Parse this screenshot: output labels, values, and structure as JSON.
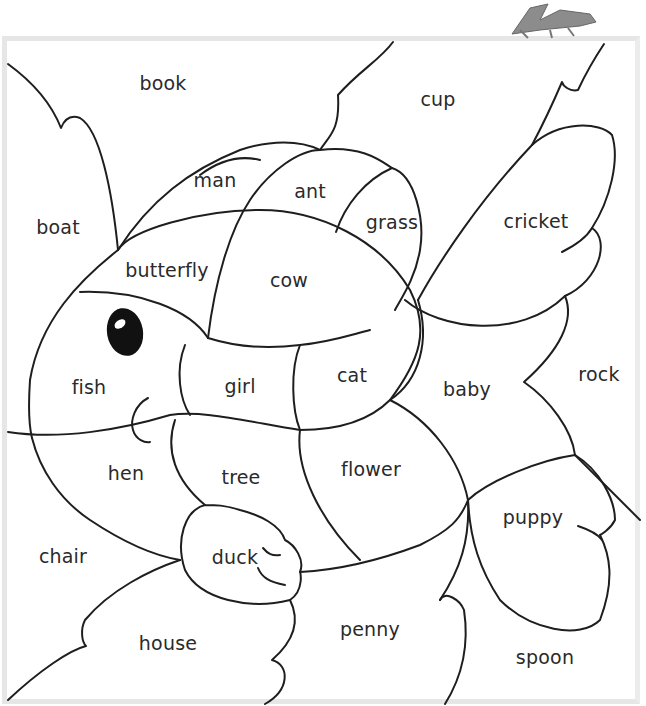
{
  "worksheet": {
    "subject": "fish",
    "mascot": "grasshopper-icon",
    "colors": {
      "line": "#1e1e1e",
      "frame": "#e6e6e6",
      "mascot_fill": "#8c8c8c",
      "eye": "#111111"
    },
    "regions": {
      "book": "book",
      "cup": "cup",
      "boat": "boat",
      "man": "man",
      "ant": "ant",
      "grass": "grass",
      "cricket": "cricket",
      "butterfly": "butterfly",
      "cow": "cow",
      "fish": "fish",
      "girl": "girl",
      "cat": "cat",
      "baby": "baby",
      "rock": "rock",
      "hen": "hen",
      "tree": "tree",
      "flower": "flower",
      "puppy": "puppy",
      "chair": "chair",
      "duck": "duck",
      "house": "house",
      "penny": "penny",
      "spoon": "spoon"
    }
  }
}
